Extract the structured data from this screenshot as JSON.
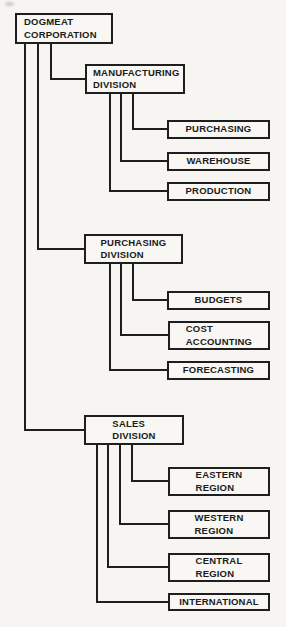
{
  "org_chart": {
    "root": {
      "label": "DOGMEAT\nCORPORATION"
    },
    "divisions": [
      {
        "label": "MANUFACTURING\nDIVISION",
        "departments": [
          {
            "label": "PURCHASING"
          },
          {
            "label": "WAREHOUSE"
          },
          {
            "label": "PRODUCTION"
          }
        ]
      },
      {
        "label": "PURCHASING\nDIVISION",
        "departments": [
          {
            "label": "BUDGETS"
          },
          {
            "label": "COST\nACCOUNTING"
          },
          {
            "label": "FORECASTING"
          }
        ]
      },
      {
        "label": "SALES\nDIVISION",
        "departments": [
          {
            "label": "EASTERN\nREGION"
          },
          {
            "label": "WESTERN\nREGION"
          },
          {
            "label": "CENTRAL\nREGION"
          },
          {
            "label": "INTERNATIONAL"
          }
        ]
      }
    ]
  },
  "colors": {
    "line": "#1e1e1e",
    "paper": "#f6f5f1",
    "box_fill": "#f8f7f3",
    "text": "#1b1b1b"
  }
}
